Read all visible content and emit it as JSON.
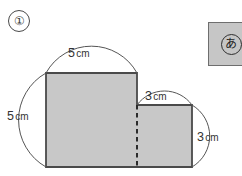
{
  "problem": {
    "number_label": "①",
    "number_plain": "1"
  },
  "figure": {
    "shape_name": "L-shaped polygon",
    "fill_color": "#c8c8c8",
    "outline_color": "#4a4a4a",
    "divider_style": "dashed",
    "dimensions": [
      {
        "id": "top",
        "value": "5",
        "unit": "cm",
        "edge": "top-left-horizontal"
      },
      {
        "id": "left",
        "value": "5",
        "unit": "cm",
        "edge": "left-vertical"
      },
      {
        "id": "step",
        "value": "3",
        "unit": "cm",
        "edge": "step-top-horizontal"
      },
      {
        "id": "right",
        "value": "3",
        "unit": "cm",
        "edge": "right-vertical"
      }
    ]
  },
  "answer_box": {
    "marker": "あ",
    "background_color": "#c6c6c6",
    "border_color": "#6e6e6e"
  }
}
